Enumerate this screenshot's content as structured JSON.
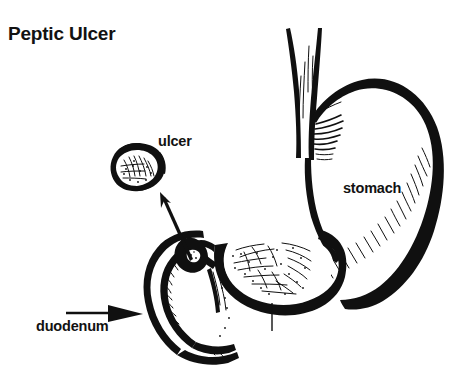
{
  "figure": {
    "title": "Peptic Ulcer",
    "background_color": "#ffffff",
    "ink_color": "#101010",
    "style": "black-and-white line drawing / medical illustration",
    "width": 461,
    "height": 372
  },
  "labels": {
    "title": "Peptic Ulcer",
    "ulcer": "ulcer",
    "stomach": "stomach",
    "duodenum": "duodenum"
  },
  "annotations": {
    "ulcer_callout": {
      "label": "ulcer",
      "description": "magnified inset of ulcer crater with thick irregular rim",
      "arrow": "diagonal arrow pointing up-left from ulcer on duodenal wall to magnified inset"
    },
    "duodenum_pointer": {
      "label": "duodenum",
      "description": "horizontal leader line with solid triangular arrowhead pointing right at the duodenal loop"
    },
    "stomach_label": {
      "label": "stomach",
      "description": "text placed inside the body of the stomach"
    },
    "pylorus_tick": {
      "description": "thin vertical tick line dropping from the lower border of the gastric antrum"
    }
  },
  "anatomy": [
    {
      "name": "esophagus",
      "description": "tube entering stomach from top"
    },
    {
      "name": "fundus",
      "description": "rounded dome at upper left of stomach body"
    },
    {
      "name": "stomach-body",
      "description": "large curved sac, greater curvature on right"
    },
    {
      "name": "antrum",
      "description": "cutaway section showing stippled mucosal lining"
    },
    {
      "name": "pylorus",
      "description": "narrow junction between stomach and duodenum"
    },
    {
      "name": "duodenum",
      "description": "C-shaped tube curving down and left from pylorus"
    },
    {
      "name": "ulcer-in-situ",
      "description": "dark crater on duodenal wall near pylorus"
    }
  ]
}
